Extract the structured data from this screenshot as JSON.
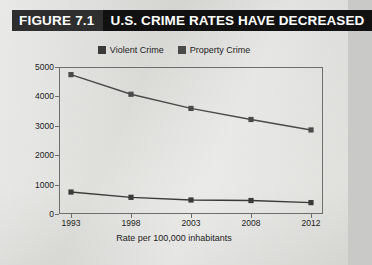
{
  "figure": {
    "tag": "FIGURE 7.1",
    "title": "U.S. CRIME RATES HAVE DECREASED"
  },
  "legend": {
    "position": "top-center",
    "items": [
      {
        "label": "Violent Crime",
        "color": "#3a3a3a"
      },
      {
        "label": "Property Crime",
        "color": "#4a4a4a"
      }
    ]
  },
  "colors": {
    "background": "#d6d6d3",
    "title_bar": "#111111",
    "figure_tag_bg": "#2e2e2e",
    "axis": "#6e6e6e",
    "violent_series": "#3a3a3a",
    "property_series": "#4a4a4a",
    "text": "#1c1c1c"
  },
  "chart_data": {
    "type": "line",
    "title": "U.S. CRIME RATES HAVE DECREASED",
    "xlabel": "Rate per 100,000 inhabitants",
    "ylabel": "",
    "categories": [
      "1993",
      "1998",
      "2003",
      "2008",
      "2012"
    ],
    "x_tick_labels": [
      "1993",
      "1998",
      "2003",
      "2008",
      "2012"
    ],
    "y_tick_labels": [
      "0",
      "1000",
      "2000",
      "3000",
      "4000",
      "5000"
    ],
    "y_ticks": [
      0,
      1000,
      2000,
      3000,
      4000,
      5000
    ],
    "ylim": [
      0,
      5000
    ],
    "grid": false,
    "legend_position": "top-center",
    "markers": "square",
    "series": [
      {
        "name": "Violent Crime",
        "color": "#3a3a3a",
        "values": [
          747,
          567,
          476,
          458,
          387
        ]
      },
      {
        "name": "Property Crime",
        "color": "#4a4a4a",
        "values": [
          4740,
          4073,
          3591,
          3215,
          2859
        ]
      }
    ]
  }
}
